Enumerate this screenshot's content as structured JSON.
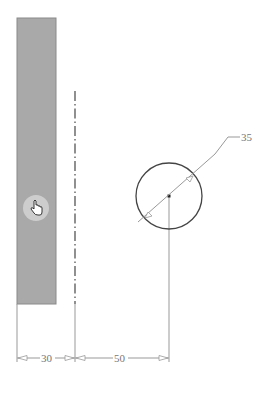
{
  "drawing": {
    "title": "Sketch with rectangle, centerline and circle",
    "colors": {
      "rect_fill": "#a9a9a9",
      "rect_stroke": "#8a8a8a",
      "centerline": "#555555",
      "circle_stroke": "#444444",
      "dimension": "#888888",
      "cursor_highlight": "#d4d4d4"
    },
    "rectangle": {
      "x": 17,
      "y": 18,
      "width": 39,
      "height": 286
    },
    "centerline": {
      "x": 75,
      "y1": 91,
      "y2": 304
    },
    "circle": {
      "cx": 169,
      "cy": 196,
      "r": 33
    },
    "dimensions": [
      {
        "id": "width",
        "label": "30"
      },
      {
        "id": "offset",
        "label": "50"
      },
      {
        "id": "diameter",
        "label": "35"
      }
    ],
    "cursor": {
      "icon": "hand-pointer-icon",
      "x": 36,
      "y": 207
    }
  }
}
